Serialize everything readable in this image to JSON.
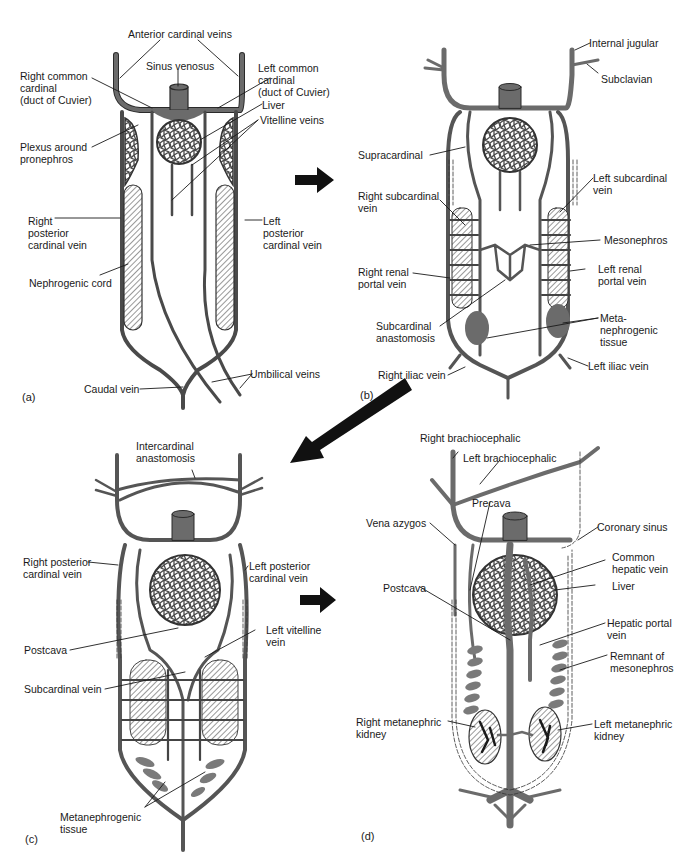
{
  "colors": {
    "vein": "#6b6b6b",
    "outline": "#2a2a2a",
    "tissue": "#7a7a7a",
    "background": "#ffffff",
    "text": "#1a1a1a"
  },
  "panels": {
    "a": {
      "tag": "(a)",
      "labels": {
        "anterior_cardinal": "Anterior cardinal veins",
        "sinus_venosus": "Sinus venosus",
        "right_common_cardinal": "Right common\ncardinal\n(duct of Cuvier)",
        "left_common_cardinal": "Left common\ncardinal\n(duct of Cuvier)",
        "liver": "Liver",
        "vitelline": "Vitelline veins",
        "plexus": "Plexus around\npronephros",
        "right_posterior_cardinal": "Right\nposterior\ncardinal vein",
        "left_posterior_cardinal": "Left\nposterior\ncardinal vein",
        "nephrogenic_cord": "Nephrogenic cord",
        "caudal_vein": "Caudal vein",
        "umbilical": "Umbilical veins"
      }
    },
    "b": {
      "tag": "(b)",
      "labels": {
        "internal_jugular": "Internal jugular",
        "subclavian": "Subclavian",
        "supracardinal": "Supracardinal",
        "right_subcardinal": "Right subcardinal\nvein",
        "left_subcardinal": "Left subcardinal\nvein",
        "mesonephros": "Mesonephros",
        "right_renal_portal": "Right renal\nportal vein",
        "left_renal_portal": "Left renal\nportal vein",
        "subcardinal_anastomosis": "Subcardinal\nanastomosis",
        "metanephrogenic": "Meta-\nnephrogenic\ntissue",
        "right_iliac": "Right iliac vein",
        "left_iliac": "Left iliac vein"
      }
    },
    "c": {
      "tag": "(c)",
      "labels": {
        "intercardinal": "Intercardinal\nanastomosis",
        "right_posterior_cardinal": "Right posterior\ncardinal vein",
        "left_posterior_cardinal": "Left posterior\ncardinal vein",
        "left_vitelline": "Left vitelline\nvein",
        "postcava": "Postcava",
        "subcardinal_vein": "Subcardinal vein",
        "metanephrogenic": "Metanephrogenic\ntissue"
      }
    },
    "d": {
      "tag": "(d)",
      "labels": {
        "right_brachiocephalic": "Right brachiocephalic",
        "left_brachiocephalic": "Left brachiocephalic",
        "precava": "Precava",
        "vena_azygos": "Vena azygos",
        "coronary_sinus": "Coronary sinus",
        "common_hepatic": "Common\nhepatic vein",
        "liver": "Liver",
        "postcava": "Postcava",
        "hepatic_portal": "Hepatic portal\nvein",
        "remnant_mesonephros": "Remnant of\nmesonephros",
        "right_metanephric": "Right metanephric\nkidney",
        "left_metanephric": "Left metanephric\nkidney"
      }
    }
  },
  "arrows": [
    "arrow-a-to-b",
    "arrow-b-to-c",
    "arrow-c-to-d"
  ]
}
